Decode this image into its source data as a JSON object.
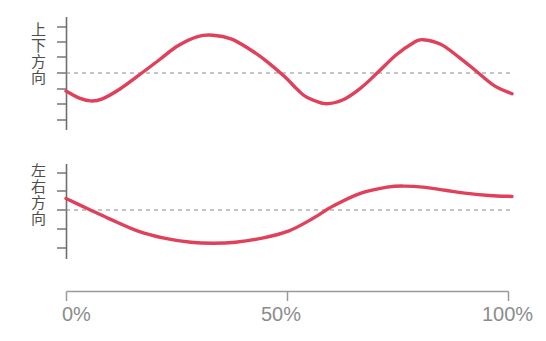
{
  "chart_data": [
    {
      "type": "line",
      "title": "",
      "panel_id": "vertical-direction",
      "ylabel": "上下方向",
      "xlabel": "",
      "x_unit": "%",
      "xlim": [
        0,
        100
      ],
      "xticks": [
        0,
        50,
        100
      ],
      "xticklabels": [
        "0%",
        "50%",
        "100%"
      ],
      "grid": false,
      "reference_line": {
        "value": 0,
        "style": "dashed",
        "color": "#808080"
      },
      "y_axis_ticks": 7,
      "series": [
        {
          "name": "上下方向",
          "color": "#e0405a",
          "x": [
            0,
            3,
            5.5,
            8,
            12,
            17,
            21,
            25,
            29.5,
            33,
            37,
            41,
            45,
            49,
            52,
            54,
            58,
            62,
            66,
            70,
            74,
            78,
            80,
            84,
            88,
            92,
            96,
            100
          ],
          "y": [
            -0.4,
            -0.56,
            -0.62,
            -0.58,
            -0.36,
            0.0,
            0.3,
            0.6,
            0.81,
            0.84,
            0.76,
            0.54,
            0.26,
            -0.08,
            -0.38,
            -0.54,
            -0.68,
            -0.6,
            -0.34,
            0.02,
            0.4,
            0.68,
            0.74,
            0.64,
            0.36,
            0.04,
            -0.28,
            -0.46
          ]
        }
      ]
    },
    {
      "type": "line",
      "title": "",
      "panel_id": "horizontal-direction",
      "ylabel": "左右方向",
      "xlabel": "",
      "x_unit": "%",
      "xlim": [
        0,
        100
      ],
      "xticks": [
        0,
        50,
        100
      ],
      "xticklabels": [
        "0%",
        "50%",
        "100%"
      ],
      "grid": false,
      "reference_line": {
        "value": 0,
        "style": "dashed",
        "color": "#808080"
      },
      "y_axis_ticks": 5,
      "series": [
        {
          "name": "左右方向",
          "color": "#e0405a",
          "x": [
            0,
            5,
            10,
            16,
            22,
            28,
            33,
            38,
            44,
            50,
            55,
            60,
            66,
            72,
            76,
            80,
            85,
            90,
            95,
            100
          ],
          "y": [
            0.22,
            0.02,
            -0.18,
            -0.4,
            -0.54,
            -0.62,
            -0.64,
            -0.62,
            -0.54,
            -0.4,
            -0.18,
            0.08,
            0.32,
            0.44,
            0.46,
            0.44,
            0.38,
            0.32,
            0.28,
            0.26
          ]
        }
      ]
    }
  ],
  "axes": {
    "vertical_panel": {
      "ylabel": "上下方向"
    },
    "horizontal_panel": {
      "ylabel": "左右方向"
    },
    "x_axis": {
      "ticklabels": [
        "0%",
        "50%",
        "100%"
      ],
      "tick_0": "0%",
      "tick_50": "50%",
      "tick_100": "100%"
    }
  },
  "colors": {
    "line": "#e0405a",
    "axis": "#6e6e6e",
    "dashed_reference": "#8a8a8a",
    "tick_label": "#8c8c8c",
    "axis_label": "#4d4d4d",
    "background": "#ffffff"
  }
}
